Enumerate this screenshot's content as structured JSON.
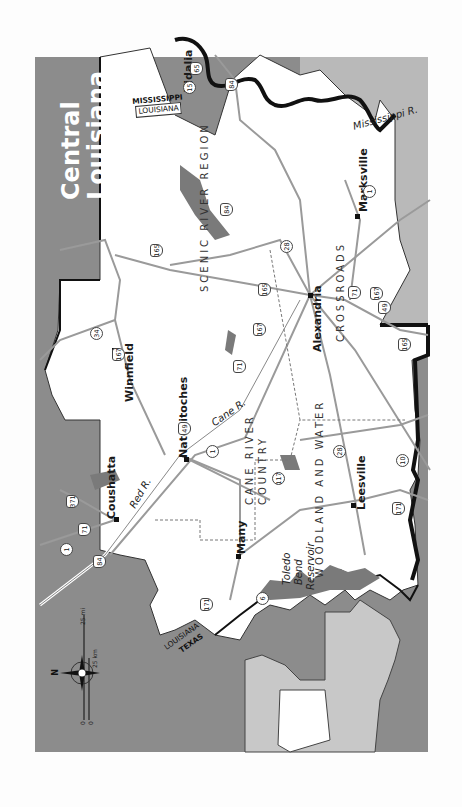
{
  "title": {
    "line1": "Central",
    "line2": "Louisiana"
  },
  "colors": {
    "frame_bg": "#8c8c8c",
    "land": "#ffffff",
    "water_light": "#b9b9b9",
    "lake": "#7a7a7a",
    "state_border": "#111111",
    "road": "#9a9a9a",
    "page_bg": "#fdfdfd",
    "inset_state": "#c8c8c8"
  },
  "cities": [
    {
      "name": "Vidalia"
    },
    {
      "name": "Marksville"
    },
    {
      "name": "Alexandria"
    },
    {
      "name": "Winnfield"
    },
    {
      "name": "Natchitoches"
    },
    {
      "name": "Coushatta"
    },
    {
      "name": "Many"
    },
    {
      "name": "Leesville"
    }
  ],
  "regions": [
    {
      "name": "SCENIC RIVER REGION"
    },
    {
      "name": "CROSSROADS"
    },
    {
      "name": "CANE RIVER"
    },
    {
      "name": "COUNTRY"
    },
    {
      "name": "WOODLAND AND WATER"
    }
  ],
  "water": [
    {
      "name": "Mississippi R."
    },
    {
      "name": "Red R."
    },
    {
      "name": "Cane R."
    },
    {
      "name": "Toledo"
    },
    {
      "name": "Bend"
    },
    {
      "name": "Reservoir"
    }
  ],
  "states": [
    {
      "name": "MISSISSIPPI"
    },
    {
      "name": "LOUISIANA"
    },
    {
      "name": "LOUISIANA"
    },
    {
      "name": "TEXAS"
    }
  ],
  "routes": [
    "65",
    "15",
    "84",
    "1",
    "28",
    "84",
    "165",
    "165",
    "34",
    "167",
    "167",
    "71",
    "71",
    "167",
    "49",
    "165",
    "28",
    "10",
    "171",
    "1",
    "117",
    "84",
    "371",
    "71",
    "1",
    "6",
    "171",
    "49"
  ],
  "scale": {
    "miles": "25 mi",
    "km": "25 km",
    "zero_mi": "0",
    "zero_km": "0"
  },
  "compass": {
    "north": "N"
  }
}
